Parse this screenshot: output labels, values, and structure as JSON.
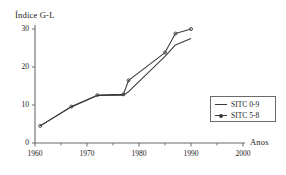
{
  "chart_data": {
    "type": "line",
    "title": "",
    "ylabel": "Índice G-L",
    "xlabel": "Anos",
    "xlim": [
      1960,
      2000
    ],
    "ylim": [
      0,
      30
    ],
    "xticks": [
      1960,
      1970,
      1980,
      1990,
      2000
    ],
    "xtick_labels": [
      "1960",
      "1970",
      "1980",
      "1990",
      "2000"
    ],
    "xminor_ticks": [
      1965,
      1975,
      1985,
      1995
    ],
    "yticks": [
      0,
      10,
      20,
      30
    ],
    "ytick_labels": [
      "0",
      "10",
      "20",
      "30"
    ],
    "grid": false,
    "legend_position": "right-center",
    "x": [
      1961,
      1967,
      1972,
      1977,
      1978,
      1985,
      1987,
      1990
    ],
    "series": [
      {
        "name": "SITC 0-9",
        "marker": "none",
        "color": "#3a3a3a",
        "values": [
          4.5,
          9.5,
          12.5,
          12.6,
          13.5,
          22.8,
          25.8,
          27.5
        ]
      },
      {
        "name": "SITC 5-8",
        "marker": "dot",
        "color": "#3a3a3a",
        "values": [
          4.5,
          9.6,
          12.6,
          12.8,
          16.5,
          23.8,
          28.8,
          30.0
        ]
      }
    ]
  },
  "legend": {
    "entries": [
      {
        "label": "SITC 0-9",
        "key": "line-key"
      },
      {
        "label": "SITC 5-8",
        "key": "line-dot-key"
      }
    ]
  },
  "colors": {
    "axis": "#6b6b6b",
    "line": "#3a3a3a",
    "text": "#1a1a1a",
    "background": "#ffffff"
  }
}
